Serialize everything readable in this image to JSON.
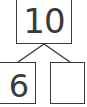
{
  "number_bond": {
    "whole": "10",
    "parts": [
      {
        "value": "6"
      },
      {
        "value": ""
      }
    ]
  },
  "colors": {
    "stroke": "#3a3a3a",
    "background": "#ffffff"
  }
}
